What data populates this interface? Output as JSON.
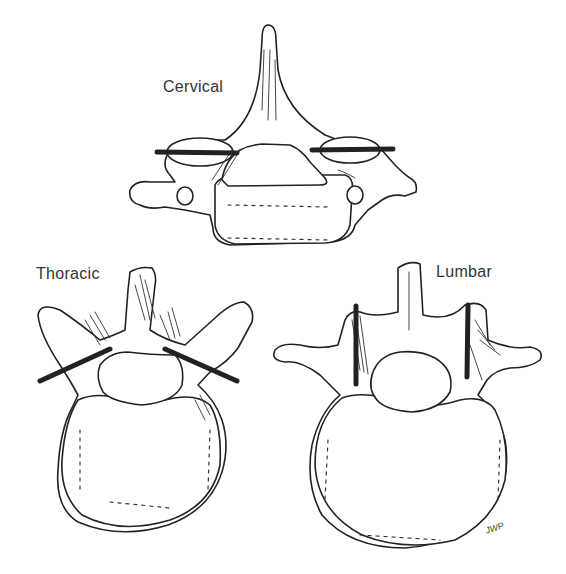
{
  "figure": {
    "labels": {
      "cervical": "Cervical",
      "thoracic": "Thoracic",
      "lumbar": "Lumbar"
    },
    "signature": "JWP",
    "colors": {
      "line": "#222222",
      "text": "#333333",
      "background": "#ffffff"
    }
  }
}
